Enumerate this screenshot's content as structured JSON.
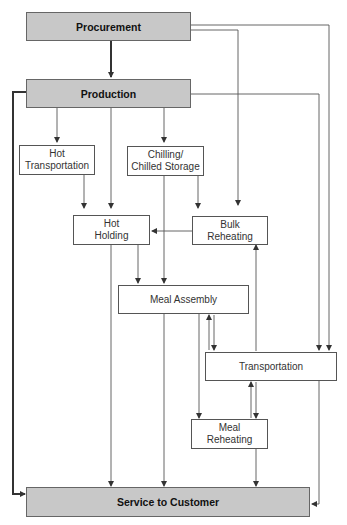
{
  "diagram": {
    "nodes": {
      "procurement": "Procurement",
      "production": "Production",
      "hot_transportation": "Hot\nTransportation",
      "chilling": "Chilling/\nChilled Storage",
      "hot_holding": "Hot\nHolding",
      "bulk_reheating": "Bulk\nReheating",
      "meal_assembly": "Meal Assembly",
      "transportation": "Transportation",
      "meal_reheating": "Meal\nReheating",
      "service": "Service to Customer"
    },
    "edges": [
      {
        "from": "Procurement",
        "to": "Production"
      },
      {
        "from": "Procurement",
        "to": "Bulk Reheating"
      },
      {
        "from": "Procurement",
        "to": "Transportation"
      },
      {
        "from": "Production",
        "to": "Hot Transportation"
      },
      {
        "from": "Production",
        "to": "Hot Holding"
      },
      {
        "from": "Production",
        "to": "Chilling/Chilled Storage"
      },
      {
        "from": "Production",
        "to": "Transportation"
      },
      {
        "from": "Production",
        "to": "Service to Customer"
      },
      {
        "from": "Hot Transportation",
        "to": "Hot Holding"
      },
      {
        "from": "Chilling/Chilled Storage",
        "to": "Bulk Reheating"
      },
      {
        "from": "Chilling/Chilled Storage",
        "to": "Meal Assembly"
      },
      {
        "from": "Bulk Reheating",
        "to": "Hot Holding"
      },
      {
        "from": "Hot Holding",
        "to": "Meal Assembly"
      },
      {
        "from": "Hot Holding",
        "to": "Service to Customer"
      },
      {
        "from": "Meal Assembly",
        "to": "Transportation"
      },
      {
        "from": "Transportation",
        "to": "Meal Assembly"
      },
      {
        "from": "Meal Assembly",
        "to": "Service to Customer"
      },
      {
        "from": "Meal Assembly",
        "to": "Meal Reheating"
      },
      {
        "from": "Transportation",
        "to": "Bulk Reheating"
      },
      {
        "from": "Transportation",
        "to": "Meal Reheating"
      },
      {
        "from": "Meal Reheating",
        "to": "Transportation"
      },
      {
        "from": "Meal Reheating",
        "to": "Service to Customer"
      },
      {
        "from": "Transportation",
        "to": "Service to Customer"
      }
    ]
  }
}
